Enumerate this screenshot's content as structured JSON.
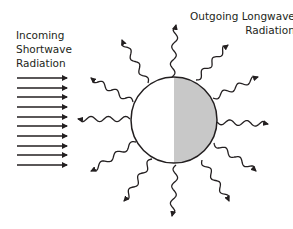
{
  "labels": {
    "incoming_line1": "Incoming",
    "incoming_line2": "Shortwave",
    "incoming_line3": "Radiation",
    "outgoing_line1": "Outgoing Longwave",
    "outgoing_line2": "Radiation"
  },
  "colors": {
    "stroke": "#231f20",
    "planet_light": "#ffffff",
    "planet_dark": "#c8c8c8",
    "background": "#ffffff"
  },
  "planet": {
    "cx": 174,
    "cy": 120,
    "r": 43
  },
  "incoming_arrows": {
    "x_start": 17,
    "x_end": 67,
    "y_positions": [
      78,
      88,
      97,
      107,
      117,
      126,
      136,
      146,
      155,
      165
    ]
  },
  "outgoing_rays": [
    {
      "name": "top",
      "from": [
        172,
        77
      ],
      "to": [
        176,
        25
      ]
    },
    {
      "name": "upper-right",
      "from": [
        196,
        80
      ],
      "to": [
        228,
        45
      ]
    },
    {
      "name": "right-upper",
      "from": [
        213,
        98
      ],
      "to": [
        258,
        77
      ]
    },
    {
      "name": "right",
      "from": [
        217,
        122
      ],
      "to": [
        268,
        124
      ]
    },
    {
      "name": "right-lower",
      "from": [
        214,
        143
      ],
      "to": [
        256,
        171
      ]
    },
    {
      "name": "lower-right",
      "from": [
        202,
        160
      ],
      "to": [
        229,
        201
      ]
    },
    {
      "name": "bottom",
      "from": [
        176,
        165
      ],
      "to": [
        172,
        216
      ]
    },
    {
      "name": "lower-left",
      "from": [
        152,
        159
      ],
      "to": [
        124,
        201
      ]
    },
    {
      "name": "left-lower",
      "from": [
        136,
        142
      ],
      "to": [
        91,
        171
      ]
    },
    {
      "name": "left",
      "from": [
        130,
        119
      ],
      "to": [
        78,
        119
      ]
    },
    {
      "name": "left-upper",
      "from": [
        133,
        102
      ],
      "to": [
        91,
        78
      ]
    },
    {
      "name": "upper-left",
      "from": [
        148,
        83
      ],
      "to": [
        122,
        40
      ]
    }
  ]
}
